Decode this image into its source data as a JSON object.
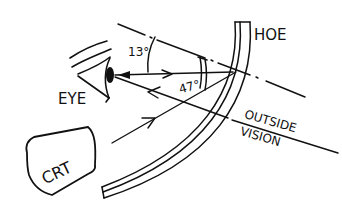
{
  "diagram": {
    "type": "hand-drawn optical schematic",
    "labels": {
      "hoe": "HOE",
      "eye": "EYE",
      "crt": "CRT",
      "outside_line1": "OUTSIDE",
      "outside_line2": "VISION",
      "angle_small": "13°",
      "angle_large": "47°"
    },
    "colors": {
      "ink": "#111111",
      "background": "#ffffff"
    }
  }
}
